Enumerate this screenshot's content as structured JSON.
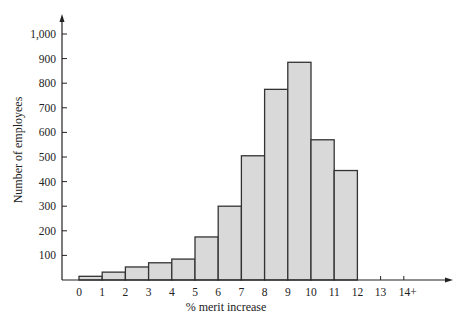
{
  "chart_data": {
    "type": "bar",
    "subtype": "histogram",
    "title": "",
    "xlabel": "% merit increase",
    "ylabel": "Number of employees",
    "x_tick_labels": [
      "0",
      "1",
      "2",
      "3",
      "4",
      "5",
      "6",
      "7",
      "8",
      "9",
      "10",
      "11",
      "12",
      "13",
      "14+"
    ],
    "y_tick_labels": [
      "100",
      "200",
      "300",
      "400",
      "500",
      "600",
      "700",
      "800",
      "900",
      "1,000"
    ],
    "y_ticks": [
      100,
      200,
      300,
      400,
      500,
      600,
      700,
      800,
      900,
      1000
    ],
    "ylim": [
      0,
      1000
    ],
    "xlim": [
      0,
      14
    ],
    "bins": [
      {
        "from": 0,
        "to": 1,
        "value": 15
      },
      {
        "from": 1,
        "to": 2,
        "value": 32
      },
      {
        "from": 2,
        "to": 3,
        "value": 53
      },
      {
        "from": 3,
        "to": 4,
        "value": 70
      },
      {
        "from": 4,
        "to": 5,
        "value": 85
      },
      {
        "from": 5,
        "to": 6,
        "value": 175
      },
      {
        "from": 6,
        "to": 7,
        "value": 300
      },
      {
        "from": 7,
        "to": 8,
        "value": 505
      },
      {
        "from": 8,
        "to": 9,
        "value": 775
      },
      {
        "from": 9,
        "to": 10,
        "value": 885
      },
      {
        "from": 10,
        "to": 11,
        "value": 570
      },
      {
        "from": 11,
        "to": 12,
        "value": 445
      }
    ],
    "categories": [
      "0-1",
      "1-2",
      "2-3",
      "3-4",
      "4-5",
      "5-6",
      "6-7",
      "7-8",
      "8-9",
      "9-10",
      "10-11",
      "11-12"
    ],
    "values": [
      15,
      32,
      53,
      70,
      85,
      175,
      300,
      505,
      775,
      885,
      570,
      445
    ],
    "grid": false,
    "legend": null,
    "colors": {
      "bar_fill": "#d9d9d9",
      "bar_stroke": "#333333",
      "axis": "#222222"
    }
  }
}
